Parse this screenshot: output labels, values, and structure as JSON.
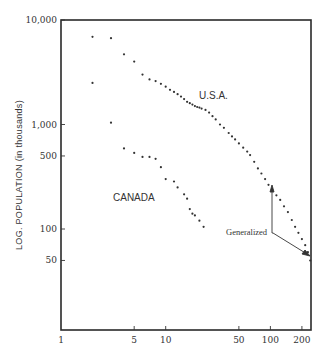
{
  "chart_data": {
    "type": "scatter",
    "title": "",
    "xlabel": "",
    "ylabel": "LOG. POPULATION (in thousands)",
    "xscale": "log",
    "yscale": "log",
    "xlim": [
      1,
      240
    ],
    "ylim": [
      21,
      10000
    ],
    "x_ticks": [
      1,
      5,
      10,
      50,
      100,
      200
    ],
    "x_tick_labels": [
      "1",
      "5",
      "10",
      "50",
      "100",
      "200"
    ],
    "y_ticks": [
      50,
      100,
      500,
      1000,
      10000
    ],
    "y_tick_labels": [
      "50",
      "100",
      "500",
      "1,000",
      "10,000"
    ],
    "grid": false,
    "legend": "none (series labeled inline)",
    "series": [
      {
        "name": "U.S.A.",
        "label_position": {
          "x": 46,
          "y": 2400
        },
        "points": [
          [
            2,
            6900
          ],
          [
            3,
            6700
          ],
          [
            4,
            4700
          ],
          [
            5,
            4000
          ],
          [
            6,
            3000
          ],
          [
            7,
            2700
          ],
          [
            8,
            2600
          ],
          [
            9,
            2450
          ],
          [
            10,
            2300
          ],
          [
            11,
            2150
          ],
          [
            12,
            2050
          ],
          [
            13,
            1950
          ],
          [
            14,
            1850
          ],
          [
            15,
            1750
          ],
          [
            16,
            1650
          ],
          [
            17,
            1600
          ],
          [
            18,
            1550
          ],
          [
            19,
            1500
          ],
          [
            20,
            1470
          ],
          [
            21,
            1450
          ],
          [
            22,
            1420
          ],
          [
            24,
            1380
          ],
          [
            26,
            1300
          ],
          [
            28,
            1200
          ],
          [
            30,
            1120
          ],
          [
            33,
            1000
          ],
          [
            36,
            930
          ],
          [
            40,
            830
          ],
          [
            43,
            770
          ],
          [
            46,
            720
          ],
          [
            50,
            660
          ],
          [
            55,
            600
          ],
          [
            60,
            550
          ],
          [
            64,
            510
          ],
          [
            70,
            440
          ],
          [
            76,
            380
          ],
          [
            82,
            340
          ],
          [
            89,
            300
          ],
          [
            96,
            265
          ],
          [
            104,
            235
          ],
          [
            114,
            210
          ],
          [
            124,
            190
          ],
          [
            135,
            165
          ],
          [
            147,
            145
          ],
          [
            160,
            122
          ],
          [
            172,
            105
          ],
          [
            185,
            92
          ],
          [
            200,
            80
          ],
          [
            215,
            70
          ],
          [
            228,
            60
          ],
          [
            240,
            50
          ]
        ]
      },
      {
        "name": "CANADA",
        "label_position": {
          "x": 4.6,
          "y": 210
        },
        "points": [
          [
            2,
            2500
          ],
          [
            3,
            1040
          ],
          [
            4,
            590
          ],
          [
            5,
            535
          ],
          [
            6,
            490
          ],
          [
            7,
            490
          ],
          [
            8,
            470
          ],
          [
            9,
            390
          ],
          [
            10,
            300
          ],
          [
            12,
            285
          ],
          [
            13,
            250
          ],
          [
            15,
            215
          ],
          [
            16,
            195
          ],
          [
            17,
            155
          ],
          [
            18,
            140
          ],
          [
            19,
            135
          ],
          [
            21,
            120
          ],
          [
            23,
            105
          ]
        ]
      }
    ],
    "annotations": [
      {
        "text": "Generalized",
        "arrows_to": [
          [
            100,
            300
          ],
          [
            240,
            50
          ]
        ]
      }
    ]
  },
  "labels": {
    "y_axis_title": "LOG. POPULATION (in thousands)",
    "usa": "U.S.A.",
    "canada": "CANADA",
    "generalized": "Generalized",
    "x_ticks": [
      "1",
      "5",
      "10",
      "50",
      "100",
      "200"
    ],
    "y_ticks": [
      "10,000",
      "1,000",
      "500",
      "100",
      "50"
    ]
  }
}
